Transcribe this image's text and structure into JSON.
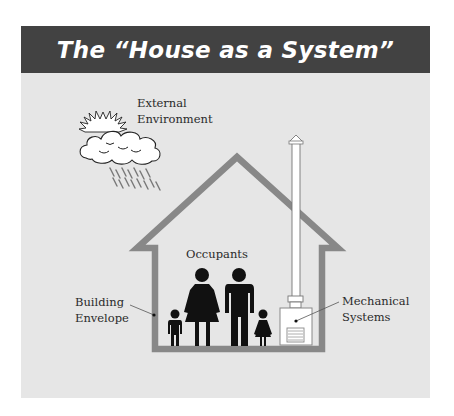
{
  "title": "The “House as a System”",
  "labels": {
    "external_environment": [
      "External",
      "Environment"
    ],
    "occupants": "Occupants",
    "building_envelope": [
      "Building",
      "Envelope"
    ],
    "mechanical_systems": [
      "Mechanical",
      "Systems"
    ]
  },
  "icons": {
    "weather": "sun-cloud-rain-icon",
    "occupants": "family-figures-icon",
    "mechanical": "furnace-chimney-icon",
    "house": "house-outline-icon"
  },
  "colors": {
    "title_bar": "#424242",
    "background": "#e6e6e6",
    "house_outline": "#888888",
    "figures": "#111111",
    "text": "#2a2a2a"
  }
}
